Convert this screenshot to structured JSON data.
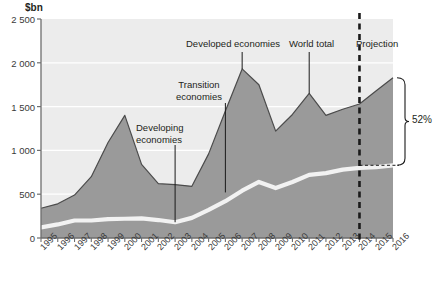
{
  "axis": {
    "y_unit_label": "$bn",
    "y_ticks": [
      "2 500",
      "2 000",
      "1 500",
      "1 000",
      "500",
      "0"
    ],
    "y_tick_values": [
      2500,
      2000,
      1500,
      1000,
      500,
      0
    ],
    "x_ticks": [
      "1995",
      "1996",
      "1997",
      "1998",
      "1999",
      "2000",
      "2001",
      "2002",
      "2003",
      "2004",
      "2005",
      "2006",
      "2007",
      "2008",
      "2009",
      "2010",
      "2011",
      "2012",
      "2013",
      "2014",
      "2015",
      "2016"
    ]
  },
  "annotations": {
    "developing": "Developing\neconomies",
    "developing_line1": "Developing",
    "developing_line2": "economies",
    "transition_line1": "Transition",
    "transition_line2": "economies",
    "developed": "Developed economies",
    "world_total": "World total",
    "projection": "Projection",
    "bracket_value": "52%"
  },
  "colors": {
    "plot_background": "#ececec",
    "area_fill": "#9a9a9a",
    "area_stroke": "#4b4b4b",
    "developing_line": "#f2f2f2",
    "gridline": "#ffffff",
    "axis": "#6e6e6e",
    "text": "#231f20",
    "dashed": "#1a1a1a"
  },
  "chart_data": {
    "type": "area",
    "title": "",
    "subtitle": "",
    "xlabel": "",
    "ylabel": "$bn",
    "ylim": [
      0,
      2500
    ],
    "grid": true,
    "legend_position": "inline-annotations",
    "x": [
      1995,
      1996,
      1997,
      1998,
      1999,
      2000,
      2001,
      2002,
      2003,
      2004,
      2005,
      2006,
      2007,
      2008,
      2009,
      2010,
      2011,
      2012,
      2013,
      2014,
      2015,
      2016
    ],
    "series": [
      {
        "name": "World total",
        "values": [
          340,
          390,
          490,
          700,
          1090,
          1400,
          840,
          620,
          610,
          590,
          960,
          1450,
          1930,
          1750,
          1220,
          1410,
          1650,
          1400,
          1470,
          1530,
          1680,
          1830
        ],
        "note": "Upper boundary of the stacked area (total FDI inflows)"
      },
      {
        "name": "Developing economies",
        "values": [
          120,
          155,
          200,
          200,
          215,
          220,
          225,
          205,
          180,
          230,
          320,
          420,
          540,
          640,
          570,
          640,
          720,
          740,
          780,
          800,
          810,
          830
        ],
        "note": "White band line inside the area"
      }
    ],
    "projection_start_year": 2014,
    "bracket": {
      "label": "52%",
      "upper_value": 1830,
      "lower_value": 830,
      "at_year": 2016
    },
    "annotations": [
      {
        "text": "Developing economies",
        "points_to_year": 2003,
        "points_to_value": 180
      },
      {
        "text": "Transition economies",
        "points_to_year": 2006,
        "points_to_value": 520
      },
      {
        "text": "Developed economies",
        "points_to_year": 2007,
        "points_to_value": 1930
      },
      {
        "text": "World total",
        "points_to_year": 2011,
        "points_to_value": 1650
      },
      {
        "text": "Projection",
        "points_to_year": 2014,
        "points_to_value": null
      }
    ]
  }
}
